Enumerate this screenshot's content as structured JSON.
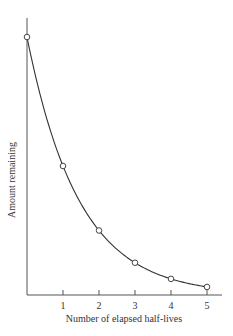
{
  "chart_data": {
    "type": "line",
    "title": "",
    "xlabel": "Number of elapsed half-lives",
    "ylabel": "Amount remaining",
    "x": [
      0,
      1,
      2,
      3,
      4,
      5
    ],
    "series": [
      {
        "name": "Amount remaining",
        "values": [
          1.0,
          0.5,
          0.25,
          0.125,
          0.0625,
          0.03125
        ],
        "markers": "open-circle",
        "smooth": true
      }
    ],
    "x_ticks": [
      "1",
      "2",
      "3",
      "4",
      "5"
    ],
    "y_ticks": [],
    "xlim": [
      0,
      5.4
    ],
    "ylim": [
      0,
      1.07
    ],
    "grid": false,
    "legend": null
  },
  "style": {
    "line_color": "#333333",
    "axis_color": "#555555",
    "marker_fill": "#ffffff"
  }
}
